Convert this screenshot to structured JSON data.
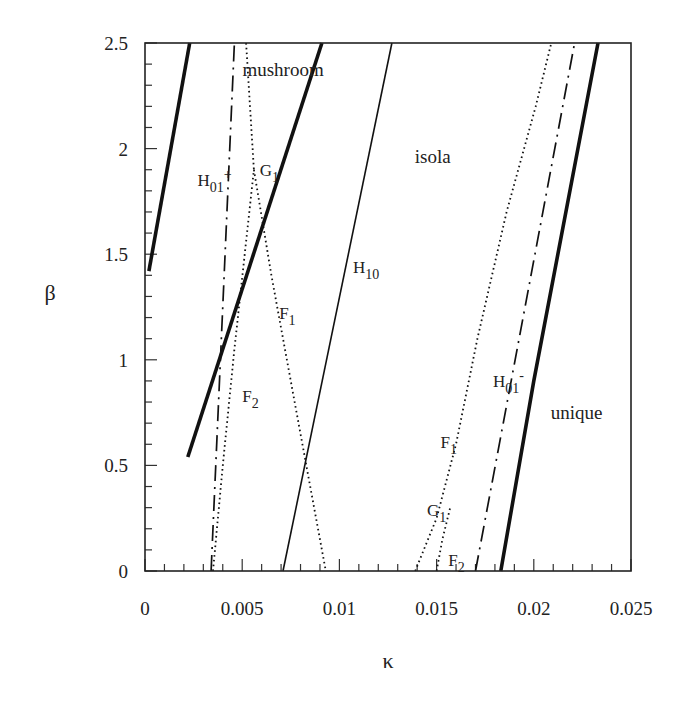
{
  "chart_data": {
    "type": "line",
    "title": "",
    "xlabel": "κ",
    "ylabel": "β",
    "xlim": [
      0,
      0.025
    ],
    "ylim": [
      0,
      2.5
    ],
    "grid": false,
    "legend": "none",
    "x_ticks": [
      {
        "value": 0,
        "label": "0"
      },
      {
        "value": 0.005,
        "label": "0.005"
      },
      {
        "value": 0.01,
        "label": "0.01"
      },
      {
        "value": 0.015,
        "label": "0.015"
      },
      {
        "value": 0.02,
        "label": "0.02"
      },
      {
        "value": 0.025,
        "label": "0.025"
      }
    ],
    "y_ticks": [
      {
        "value": 0,
        "label": "0"
      },
      {
        "value": 0.5,
        "label": "0.5"
      },
      {
        "value": 1,
        "label": "1"
      },
      {
        "value": 1.5,
        "label": "1.5"
      },
      {
        "value": 2,
        "label": "2"
      },
      {
        "value": 2.5,
        "label": "2.5"
      }
    ],
    "x_minor_step": 0.001,
    "y_minor_step": 0.1,
    "region_labels": [
      {
        "text": "mushroom",
        "x": 0.0071,
        "y": 2.37
      },
      {
        "text": "isola",
        "x": 0.0148,
        "y": 1.96
      },
      {
        "text": "unique",
        "x": 0.0222,
        "y": 0.75
      }
    ],
    "series": [
      {
        "name": "thick-left",
        "style": "thick-solid",
        "points": [
          [
            0.0002,
            1.42
          ],
          [
            0.0023,
            2.5
          ]
        ]
      },
      {
        "name": "thick-middle",
        "style": "thick-solid",
        "points": [
          [
            0.0022,
            0.54
          ],
          [
            0.0091,
            2.5
          ]
        ]
      },
      {
        "name": "H10",
        "style": "thin-solid",
        "points": [
          [
            0.0071,
            0
          ],
          [
            0.0127,
            2.5
          ]
        ]
      },
      {
        "name": "H01+",
        "style": "dash-dot",
        "points": [
          [
            0.0034,
            0
          ],
          [
            0.0046,
            2.5
          ]
        ]
      },
      {
        "name": "G1-left",
        "style": "dotted",
        "points": [
          [
            0.0052,
            2.5
          ],
          [
            0.0054,
            2.2
          ],
          [
            0.0056,
            1.9
          ]
        ]
      },
      {
        "name": "F1-left",
        "style": "dotted",
        "points": [
          [
            0.0056,
            1.9
          ],
          [
            0.0065,
            1.4
          ],
          [
            0.0076,
            0.85
          ],
          [
            0.0085,
            0.4
          ],
          [
            0.0093,
            0
          ]
        ]
      },
      {
        "name": "F2-left",
        "style": "dotted",
        "points": [
          [
            0.0035,
            0
          ],
          [
            0.004,
            0.5
          ],
          [
            0.0046,
            1.05
          ],
          [
            0.0056,
            1.9
          ]
        ]
      },
      {
        "name": "F1-right",
        "style": "dotted",
        "points": [
          [
            0.0139,
            0
          ],
          [
            0.015,
            0.25
          ],
          [
            0.016,
            0.6
          ],
          [
            0.0171,
            1.1
          ],
          [
            0.0186,
            1.7
          ],
          [
            0.0201,
            2.2
          ],
          [
            0.0209,
            2.5
          ]
        ]
      },
      {
        "name": "G1-right",
        "style": "dotted",
        "points": [
          [
            0.015,
            0
          ],
          [
            0.0153,
            0.15
          ],
          [
            0.0157,
            0.3
          ]
        ]
      },
      {
        "name": "H01-",
        "style": "dash-dot",
        "points": [
          [
            0.017,
            0
          ],
          [
            0.0221,
            2.5
          ]
        ]
      },
      {
        "name": "thick-right",
        "style": "thick-solid",
        "points": [
          [
            0.0183,
            0
          ],
          [
            0.02,
            0.9
          ],
          [
            0.0233,
            2.5
          ]
        ]
      }
    ],
    "curve_labels": [
      {
        "text": "H",
        "sub": "01",
        "sup": "+",
        "x": 0.0027,
        "y": 1.85
      },
      {
        "text": "G",
        "sub": "1",
        "sup": "",
        "x": 0.0059,
        "y": 1.9
      },
      {
        "text": "H",
        "sub": "10",
        "sup": "",
        "x": 0.0107,
        "y": 1.44
      },
      {
        "text": "F",
        "sub": "1",
        "sup": "",
        "x": 0.0069,
        "y": 1.22
      },
      {
        "text": "F",
        "sub": "2",
        "sup": "",
        "x": 0.005,
        "y": 0.83
      },
      {
        "text": "H",
        "sub": "01",
        "sup": "-",
        "x": 0.0179,
        "y": 0.9
      },
      {
        "text": "F",
        "sub": "1",
        "sup": "",
        "x": 0.0152,
        "y": 0.61
      },
      {
        "text": "G",
        "sub": "1",
        "sup": "",
        "x": 0.0145,
        "y": 0.29
      },
      {
        "text": "F",
        "sub": "2",
        "sup": "",
        "x": 0.0156,
        "y": 0.05
      }
    ]
  }
}
